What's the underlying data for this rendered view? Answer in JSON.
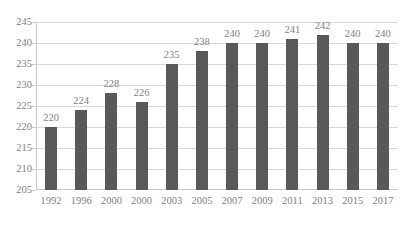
{
  "chart_data": {
    "type": "bar",
    "title": "",
    "subtitle": "",
    "xlabel": "",
    "ylabel": "",
    "categories": [
      "1992",
      "1996",
      "2000",
      "2000",
      "2003",
      "2005",
      "2007",
      "2009",
      "2011",
      "2013",
      "2015",
      "2017"
    ],
    "values": [
      220,
      224,
      228,
      226,
      235,
      238,
      240,
      240,
      241,
      242,
      240,
      240
    ],
    "data_labels": [
      "220",
      "224",
      "228",
      "226",
      "235",
      "238",
      "240",
      "240",
      "241",
      "242",
      "240",
      "240"
    ],
    "ylim": [
      205,
      245
    ],
    "ytick_labels": [
      "245",
      "240",
      "235",
      "230",
      "225",
      "220",
      "215",
      "210",
      "205"
    ],
    "ytick_values": [
      245,
      240,
      235,
      230,
      225,
      220,
      215,
      210,
      205
    ],
    "grid": true,
    "legend": false,
    "legend_position": "none",
    "series": [
      {
        "name": "",
        "values": [
          220,
          224,
          228,
          226,
          235,
          238,
          240,
          240,
          241,
          242,
          240,
          240
        ]
      }
    ]
  },
  "style": {
    "bar_color": "#595959",
    "grid_color": "#d9d9d9",
    "axis_color": "#c9c9c9",
    "text_color": "#7f7f7f",
    "background": "#ffffff"
  }
}
